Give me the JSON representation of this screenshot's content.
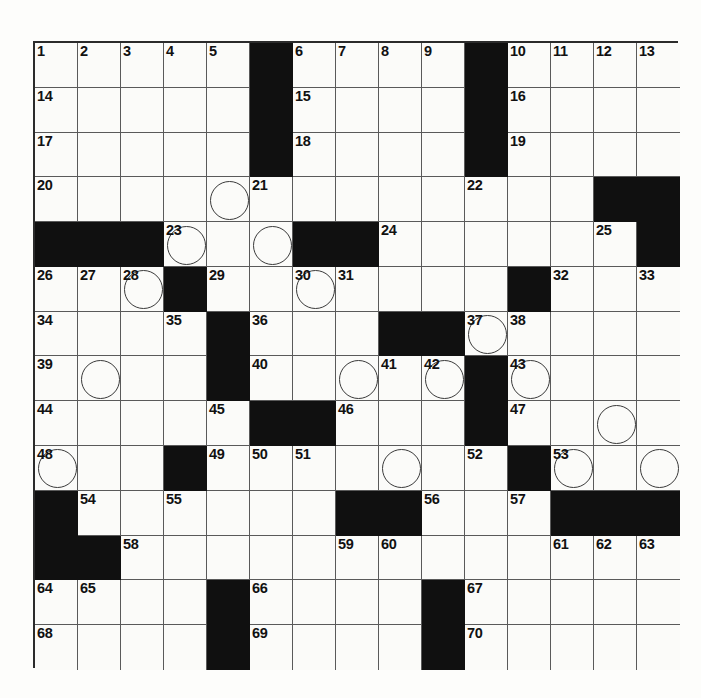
{
  "page": {
    "type": "crossword-puzzle-grid",
    "background_color": "#fdfdfb",
    "grid_line_color": "#5a5a5a",
    "block_color": "#101010",
    "cell_color": "#fbfbf9",
    "circle_color": "#3a3a3a"
  },
  "grid": {
    "columns": 15,
    "rows": 14,
    "cell_width": 43,
    "cell_height": 44.785,
    "origin_x": 33,
    "origin_y": 41,
    "total_clues": 73,
    "blocks": [
      [
        0,
        5
      ],
      [
        0,
        10
      ],
      [
        1,
        5
      ],
      [
        1,
        10
      ],
      [
        2,
        5
      ],
      [
        2,
        10
      ],
      [
        3,
        13
      ],
      [
        3,
        14
      ],
      [
        4,
        0
      ],
      [
        4,
        1
      ],
      [
        4,
        2
      ],
      [
        4,
        6
      ],
      [
        4,
        7
      ],
      [
        4,
        14
      ],
      [
        5,
        3
      ],
      [
        5,
        11
      ],
      [
        6,
        4
      ],
      [
        6,
        8
      ],
      [
        6,
        9
      ],
      [
        7,
        4
      ],
      [
        7,
        10
      ],
      [
        8,
        5
      ],
      [
        8,
        6
      ],
      [
        8,
        10
      ],
      [
        9,
        3
      ],
      [
        9,
        11
      ],
      [
        10,
        0
      ],
      [
        10,
        7
      ],
      [
        10,
        8
      ],
      [
        10,
        12
      ],
      [
        10,
        13
      ],
      [
        10,
        14
      ],
      [
        11,
        0
      ],
      [
        11,
        1
      ],
      [
        12,
        4
      ],
      [
        12,
        9
      ],
      [
        13,
        4
      ],
      [
        13,
        9
      ]
    ],
    "numbers": [
      {
        "row": 0,
        "col": 0,
        "n": "1"
      },
      {
        "row": 0,
        "col": 1,
        "n": "2"
      },
      {
        "row": 0,
        "col": 2,
        "n": "3"
      },
      {
        "row": 0,
        "col": 3,
        "n": "4"
      },
      {
        "row": 0,
        "col": 4,
        "n": "5"
      },
      {
        "row": 0,
        "col": 6,
        "n": "6"
      },
      {
        "row": 0,
        "col": 7,
        "n": "7"
      },
      {
        "row": 0,
        "col": 8,
        "n": "8"
      },
      {
        "row": 0,
        "col": 9,
        "n": "9"
      },
      {
        "row": 0,
        "col": 11,
        "n": "10"
      },
      {
        "row": 0,
        "col": 12,
        "n": "11"
      },
      {
        "row": 0,
        "col": 13,
        "n": "12"
      },
      {
        "row": 0,
        "col": 14,
        "n": "13"
      },
      {
        "row": 1,
        "col": 0,
        "n": "14"
      },
      {
        "row": 1,
        "col": 6,
        "n": "15"
      },
      {
        "row": 1,
        "col": 11,
        "n": "16"
      },
      {
        "row": 2,
        "col": 0,
        "n": "17"
      },
      {
        "row": 2,
        "col": 6,
        "n": "18"
      },
      {
        "row": 2,
        "col": 11,
        "n": "19"
      },
      {
        "row": 3,
        "col": 0,
        "n": "20"
      },
      {
        "row": 3,
        "col": 5,
        "n": "21"
      },
      {
        "row": 3,
        "col": 10,
        "n": "22"
      },
      {
        "row": 4,
        "col": 3,
        "n": "23"
      },
      {
        "row": 4,
        "col": 8,
        "n": "24"
      },
      {
        "row": 4,
        "col": 13,
        "n": "25"
      },
      {
        "row": 5,
        "col": 0,
        "n": "26"
      },
      {
        "row": 5,
        "col": 1,
        "n": "27"
      },
      {
        "row": 5,
        "col": 2,
        "n": "28"
      },
      {
        "row": 5,
        "col": 4,
        "n": "29"
      },
      {
        "row": 5,
        "col": 6,
        "n": "30"
      },
      {
        "row": 5,
        "col": 7,
        "n": "31"
      },
      {
        "row": 5,
        "col": 12,
        "n": "32"
      },
      {
        "row": 5,
        "col": 14,
        "n": "33"
      },
      {
        "row": 6,
        "col": 0,
        "n": "34"
      },
      {
        "row": 6,
        "col": 3,
        "n": "35"
      },
      {
        "row": 6,
        "col": 5,
        "n": "36"
      },
      {
        "row": 6,
        "col": 10,
        "n": "37"
      },
      {
        "row": 6,
        "col": 11,
        "n": "38"
      },
      {
        "row": 7,
        "col": 0,
        "n": "39"
      },
      {
        "row": 7,
        "col": 5,
        "n": "40"
      },
      {
        "row": 7,
        "col": 8,
        "n": "41"
      },
      {
        "row": 7,
        "col": 9,
        "n": "42"
      },
      {
        "row": 7,
        "col": 11,
        "n": "43"
      },
      {
        "row": 8,
        "col": 0,
        "n": "44"
      },
      {
        "row": 8,
        "col": 4,
        "n": "45"
      },
      {
        "row": 8,
        "col": 7,
        "n": "46"
      },
      {
        "row": 8,
        "col": 11,
        "n": "47"
      },
      {
        "row": 9,
        "col": 0,
        "n": "48"
      },
      {
        "row": 9,
        "col": 4,
        "n": "49"
      },
      {
        "row": 9,
        "col": 5,
        "n": "50"
      },
      {
        "row": 9,
        "col": 6,
        "n": "51"
      },
      {
        "row": 9,
        "col": 10,
        "n": "52"
      },
      {
        "row": 9,
        "col": 12,
        "n": "53"
      },
      {
        "row": 10,
        "col": 1,
        "n": "54"
      },
      {
        "row": 10,
        "col": 3,
        "n": "55"
      },
      {
        "row": 10,
        "col": 9,
        "n": "56"
      },
      {
        "row": 10,
        "col": 11,
        "n": "57"
      },
      {
        "row": 11,
        "col": 2,
        "n": "58"
      },
      {
        "row": 11,
        "col": 7,
        "n": "59"
      },
      {
        "row": 11,
        "col": 8,
        "n": "60"
      },
      {
        "row": 11,
        "col": 12,
        "n": "61"
      },
      {
        "row": 11,
        "col": 13,
        "n": "62"
      },
      {
        "row": 11,
        "col": 14,
        "n": "63"
      },
      {
        "row": 12,
        "col": 0,
        "n": "64"
      },
      {
        "row": 12,
        "col": 1,
        "n": "65"
      },
      {
        "row": 12,
        "col": 5,
        "n": "66"
      },
      {
        "row": 12,
        "col": 10,
        "n": "67"
      },
      {
        "row": 13,
        "col": 0,
        "n": "68"
      },
      {
        "row": 13,
        "col": 5,
        "n": "69"
      },
      {
        "row": 13,
        "col": 10,
        "n": "70"
      },
      {
        "row": 14,
        "col": 0,
        "n": "71"
      },
      {
        "row": 14,
        "col": 5,
        "n": "72"
      },
      {
        "row": 14,
        "col": 10,
        "n": "73"
      }
    ],
    "circles": [
      [
        3,
        4
      ],
      [
        4,
        3
      ],
      [
        4,
        5
      ],
      [
        5,
        2
      ],
      [
        5,
        6
      ],
      [
        6,
        10
      ],
      [
        7,
        1
      ],
      [
        7,
        7
      ],
      [
        7,
        9
      ],
      [
        7,
        11
      ],
      [
        8,
        13
      ],
      [
        9,
        0
      ],
      [
        9,
        8
      ],
      [
        9,
        12
      ],
      [
        9,
        14
      ]
    ]
  }
}
